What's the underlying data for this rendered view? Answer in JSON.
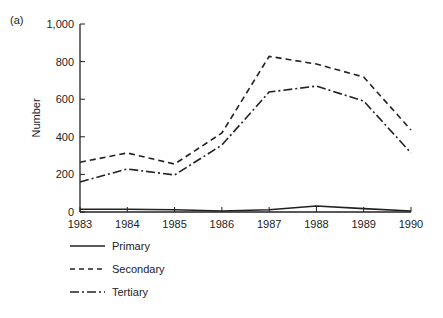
{
  "panel_label": "(a)",
  "chart_data": {
    "type": "line",
    "title": "",
    "xlabel": "",
    "ylabel": "Number",
    "ylim": [
      0,
      1000
    ],
    "yticks": [
      0,
      200,
      400,
      600,
      800,
      1000
    ],
    "ytick_labels": [
      "0",
      "200",
      "400",
      "600",
      "800",
      "1,000"
    ],
    "x": [
      1983,
      1984,
      1985,
      1986,
      1987,
      1988,
      1989,
      1990
    ],
    "xtick_labels": [
      "1983",
      "1984",
      "1985",
      "1986",
      "1987",
      "1988",
      "1989",
      "1990"
    ],
    "grid": false,
    "legend_position": "below",
    "series": [
      {
        "name": "Primary",
        "style": "solid",
        "values": [
          15,
          15,
          12,
          5,
          12,
          32,
          18,
          5
        ]
      },
      {
        "name": "Secondary",
        "style": "dashed",
        "values": [
          265,
          314,
          255,
          420,
          828,
          787,
          718,
          436
        ]
      },
      {
        "name": "Tertiary",
        "style": "dash-dot",
        "values": [
          160,
          229,
          197,
          356,
          638,
          670,
          590,
          314
        ]
      }
    ]
  },
  "legend": {
    "items": [
      {
        "label": "Primary"
      },
      {
        "label": "Secondary"
      },
      {
        "label": "Tertiary"
      }
    ]
  }
}
